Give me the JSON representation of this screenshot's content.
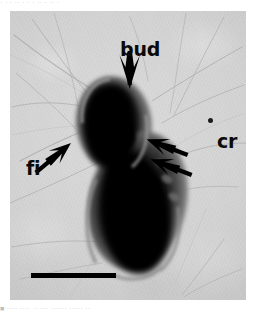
{
  "page": {
    "top_cropped_text": "· ·    · ··        ·  ·        · ·· ·    ··  ·",
    "bottom_cropped_caption": "■ ····   ····    ··   ···   ······  ····· ··"
  },
  "figure": {
    "kind": "electron-micrograph",
    "background_color": "#d4d4d4",
    "cell_color": "#000000",
    "annotation_color": "#0a0a0a"
  },
  "annotations": [
    {
      "id": "bud",
      "label": "bud",
      "arrow": "down-arrow",
      "points_to": "bud neck at top of cell"
    },
    {
      "id": "fi",
      "label": "fi",
      "arrow": "up-right-arrow",
      "points_to": "background fibril"
    },
    {
      "id": "cr",
      "label": "cr",
      "arrow": "double-down-left-arrow",
      "points_to": "crateriform structures on mother cell surface"
    }
  ],
  "scale_bar": {
    "label": "",
    "color": "#000000"
  }
}
